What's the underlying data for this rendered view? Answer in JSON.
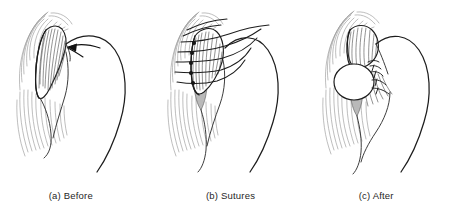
{
  "figure": {
    "title": "",
    "type": "medical-line-illustration",
    "panel_count": 3,
    "background_color": "#ffffff",
    "line_color": "#1d1d1d",
    "striation_color": "#9a9a9a",
    "hatch_color": "#4a4a4a",
    "shade_color": "#b9b9b9"
  },
  "panels": [
    {
      "id": "a",
      "caption": "(a) Before",
      "label": "(a)",
      "name": "Before",
      "elements": [
        "muscle-striations",
        "hatched-tendon-flap",
        "shaded-defect-wedge",
        "humeral-head-curve",
        "direction-arrow"
      ],
      "annotation": "arrow indicating retracted tendon edge"
    },
    {
      "id": "b",
      "caption": "(b) Sutures",
      "label": "(b)",
      "name": "Sutures",
      "elements": [
        "muscle-striations",
        "hatched-tendon-flap",
        "shaded-defect-wedge",
        "humeral-head-curve",
        "suture-threads",
        "suture-knots"
      ],
      "suture_count": 5,
      "knot_count": 5
    },
    {
      "id": "c",
      "caption": "(c) After",
      "label": "(c)",
      "name": "After",
      "elements": [
        "muscle-striations",
        "hatched-tendon-flap",
        "shaded-defect-wedge",
        "humeral-head-curve",
        "repaired-bulge",
        "closed-stitches"
      ],
      "stitch_count": 4
    }
  ]
}
